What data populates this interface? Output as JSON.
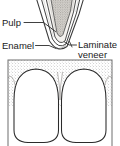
{
  "figure": {
    "title_present": false,
    "panels": [
      {
        "name": "tooth-cross-section",
        "description": "sagittal cross-section of an incisor showing nested layers"
      },
      {
        "name": "two-teeth-frontal",
        "description": "frontal view of two adjacent incisors within a bordered box"
      }
    ]
  },
  "labels": {
    "pulp": "Pulp",
    "enamel": "Enamel",
    "laminate_line1": "Laminate",
    "laminate_line2": "veneer"
  },
  "colors": {
    "ink": "#1a1a1a",
    "outline": "#2b2b2b",
    "stipple": "#9a9a9a",
    "pulp_fill": "#b9b6b0",
    "dentin_fill": "#e9e7e3",
    "tooth_fill": "#ffffff",
    "background": "#ffffff",
    "box_border": "#6e6e6e"
  },
  "geometry": {
    "width": 120,
    "height": 146,
    "box": {
      "x": 8,
      "y": 60,
      "width": 104,
      "height": 88
    },
    "midline_x": 60
  }
}
